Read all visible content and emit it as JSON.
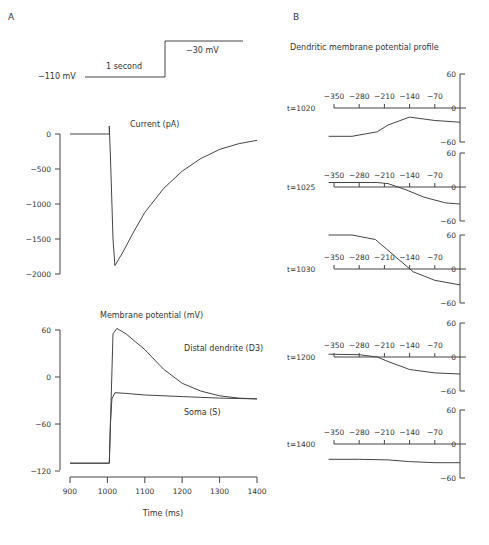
{
  "panel_labels": {
    "a": "A",
    "b": "B"
  },
  "protocol": {
    "low_label": "−110 mV",
    "high_label": "−30 mV",
    "duration_label": "1 second"
  },
  "chart_data": [
    {
      "type": "line",
      "id": "current",
      "title": "Current (pA)",
      "xlabel": "Time (ms)",
      "ylabel": "Current (pA)",
      "xlim": [
        900,
        1400
      ],
      "ylim": [
        -2000,
        0
      ],
      "yticks": [
        0,
        -500,
        -1000,
        -1500,
        -2000
      ],
      "ytick_labels": [
        "0",
        "−500",
        "−1000",
        "−1500",
        "−2000"
      ],
      "series": [
        {
          "name": "Current",
          "x": [
            900,
            1005,
            1008,
            1015,
            1020,
            1040,
            1070,
            1100,
            1150,
            1200,
            1250,
            1300,
            1350,
            1400
          ],
          "y": [
            0,
            0,
            -300,
            -1500,
            -1880,
            -1700,
            -1400,
            -1120,
            -780,
            -530,
            -350,
            -220,
            -140,
            -90
          ]
        }
      ],
      "grid": false
    },
    {
      "type": "line",
      "id": "membrane",
      "title": "Membrane potential (mV)",
      "xlabel": "Time (ms)",
      "ylabel": "Membrane potential (mV)",
      "xlim": [
        900,
        1400
      ],
      "ylim": [
        -120,
        60
      ],
      "xticks": [
        900,
        1000,
        1100,
        1200,
        1300,
        1400
      ],
      "xtick_labels": [
        "900",
        "1000",
        "1100",
        "1200",
        "1300",
        "1400"
      ],
      "yticks": [
        60,
        0,
        -60,
        -120
      ],
      "ytick_labels": [
        "60",
        "0",
        "−60",
        "−120"
      ],
      "series": [
        {
          "name": "Distal dendrite (D3)",
          "x": [
            900,
            1005,
            1010,
            1015,
            1025,
            1050,
            1100,
            1150,
            1200,
            1250,
            1300,
            1350,
            1400
          ],
          "y": [
            -110,
            -110,
            -30,
            55,
            62,
            55,
            35,
            10,
            -8,
            -18,
            -24,
            -27,
            -28
          ]
        },
        {
          "name": "Soma (S)",
          "x": [
            900,
            1005,
            1008,
            1012,
            1020,
            1050,
            1100,
            1200,
            1300,
            1400
          ],
          "y": [
            -110,
            -110,
            -60,
            -28,
            -20,
            -21,
            -23,
            -25,
            -27,
            -28
          ]
        }
      ],
      "annotations": [
        "Distal dendrite (D3)",
        "Soma (S)"
      ],
      "grid": false
    },
    {
      "type": "line",
      "id": "profiles",
      "title": "Dendritic membrane potential profile",
      "xticks": [
        -350,
        -280,
        -210,
        -140,
        -70
      ],
      "xtick_labels": [
        "−350",
        "−280",
        "−210",
        "−140",
        "−70"
      ],
      "xlim": [
        -350,
        0
      ],
      "ylim": [
        -60,
        60
      ],
      "yticks": [
        60,
        0,
        -60
      ],
      "ytick_labels": [
        "60",
        "0",
        "−60"
      ],
      "series": [
        {
          "name": "t=1020",
          "x": [
            -365,
            -300,
            -230,
            -200,
            -140,
            -70,
            0
          ],
          "y": [
            -50,
            -50,
            -42,
            -30,
            -16,
            -22,
            -25
          ]
        },
        {
          "name": "t=1025",
          "x": [
            -365,
            -230,
            -200,
            -150,
            -100,
            -40,
            0
          ],
          "y": [
            8,
            8,
            6,
            -5,
            -18,
            -28,
            -30
          ]
        },
        {
          "name": "t=1030",
          "x": [
            -365,
            -300,
            -235,
            -180,
            -130,
            -70,
            0
          ],
          "y": [
            60,
            60,
            52,
            22,
            -5,
            -20,
            -28
          ]
        },
        {
          "name": "t=1200",
          "x": [
            -365,
            -280,
            -230,
            -200,
            -140,
            -70,
            0
          ],
          "y": [
            5,
            4,
            0,
            -8,
            -22,
            -28,
            -30
          ]
        },
        {
          "name": "t=1400",
          "x": [
            -365,
            -280,
            -200,
            -140,
            -70,
            0
          ],
          "y": [
            -27,
            -27,
            -28,
            -31,
            -33,
            -33
          ]
        }
      ]
    }
  ],
  "profile_labels": [
    "t=1020",
    "t=1025",
    "t=1030",
    "t=1200",
    "t=1400"
  ]
}
